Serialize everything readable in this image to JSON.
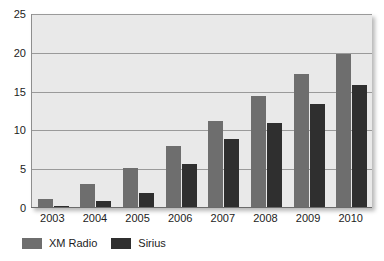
{
  "chart_data": {
    "type": "bar",
    "title": "",
    "xlabel": "",
    "ylabel": "",
    "ylim": [
      0,
      25
    ],
    "yticks": [
      0,
      5,
      10,
      15,
      20,
      25
    ],
    "grid": true,
    "legend_position": "bottom-left",
    "categories": [
      "2003",
      "2004",
      "2005",
      "2006",
      "2007",
      "2008",
      "2009",
      "2010"
    ],
    "series": [
      {
        "name": "XM Radio",
        "color": "#6e6e6e",
        "values": [
          1.2,
          3.1,
          5.2,
          8.0,
          11.2,
          14.4,
          17.3,
          19.8
        ]
      },
      {
        "name": "Sirius",
        "color": "#2f2f2f",
        "values": [
          0.2,
          0.9,
          1.9,
          5.7,
          8.9,
          11.0,
          13.4,
          15.8
        ]
      }
    ]
  },
  "axes": {
    "y_tick_labels": [
      "25",
      "20",
      "15",
      "10",
      "5",
      "0"
    ],
    "x_tick_labels": [
      "2003",
      "2004",
      "2005",
      "2006",
      "2007",
      "2008",
      "2009",
      "2010"
    ]
  },
  "legend": {
    "entries": [
      {
        "label": "XM Radio",
        "color": "#6e6e6e"
      },
      {
        "label": "Sirius",
        "color": "#2f2f2f"
      }
    ]
  },
  "colors": {
    "plot_background": "#e9e9e9",
    "gridline": "#9a9a9a",
    "axis": "#6b6b6b",
    "text": "#1c1c1c",
    "page_background": "#ffffff"
  }
}
